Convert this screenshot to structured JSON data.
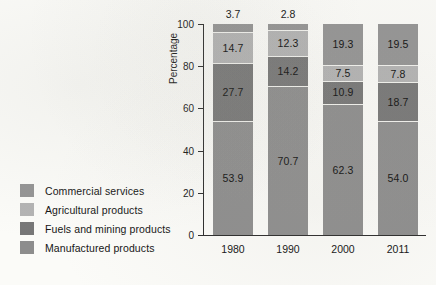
{
  "chart_data": {
    "type": "bar",
    "subtype": "stacked-100-percent",
    "title": "",
    "xlabel": "",
    "ylabel": "Percentage",
    "ylim": [
      0,
      100
    ],
    "yticks": [
      0,
      20,
      40,
      60,
      80,
      100
    ],
    "grid": false,
    "legend_position": "left",
    "categories": [
      "1980",
      "1990",
      "2000",
      "2011"
    ],
    "stack_order_bottom_to_top": [
      "Manufactured products",
      "Fuels and mining products",
      "Agricultural products",
      "Commercial services"
    ],
    "series": [
      {
        "name": "Manufactured products",
        "color": "#8d8d8d",
        "values": [
          53.9,
          70.7,
          62.3,
          54.0
        ],
        "labels": [
          "53.9",
          "70.7",
          "62.3",
          "54.0"
        ]
      },
      {
        "name": "Fuels and mining products",
        "color": "#777777",
        "values": [
          27.7,
          14.2,
          10.9,
          18.7
        ],
        "labels": [
          "27.7",
          "14.2",
          "10.9",
          "18.7"
        ]
      },
      {
        "name": "Agricultural products",
        "color": "#b3b3b3",
        "values": [
          14.7,
          12.3,
          7.5,
          7.8
        ],
        "labels": [
          "14.7",
          "12.3",
          "7.5",
          "7.8"
        ]
      },
      {
        "name": "Commercial services",
        "color": "#949494",
        "values": [
          3.7,
          2.8,
          19.3,
          19.5
        ],
        "labels": [
          "3.7",
          "2.8",
          "19.3",
          "19.5"
        ]
      }
    ],
    "annotations_above_bars": [
      "3.7",
      "2.8",
      "",
      ""
    ]
  },
  "legend": {
    "items": [
      {
        "label": "Commercial services",
        "color": "#949494"
      },
      {
        "label": "Agricultural products",
        "color": "#b3b3b3"
      },
      {
        "label": "Fuels and mining products",
        "color": "#777777"
      },
      {
        "label": "Manufactured products",
        "color": "#8d8d8d"
      }
    ]
  },
  "axis": {
    "y_title": "Percentage",
    "y_tick_labels": [
      "0",
      "20",
      "40",
      "60",
      "80",
      "100"
    ],
    "x_tick_labels": [
      "1980",
      "1990",
      "2000",
      "2011"
    ]
  }
}
